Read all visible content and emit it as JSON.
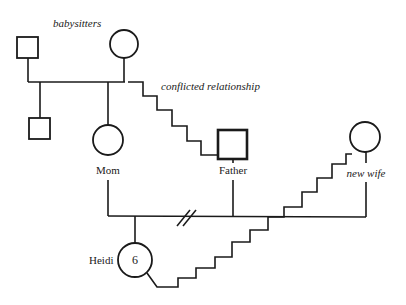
{
  "diagram": {
    "type": "genogram",
    "colors": {
      "ink": "#1a1a1a",
      "background": "#ffffff"
    },
    "labels": {
      "babysitters": "babysitters",
      "conflicted": "conflicted relationship",
      "mom": "Mom",
      "father": "Father",
      "new_wife": "new wife",
      "heidi": "Heidi",
      "heidi_age": "6"
    },
    "people": [
      {
        "id": "babysitter-male",
        "role": "babysitter",
        "sex": "male"
      },
      {
        "id": "babysitter-female",
        "role": "babysitter",
        "sex": "female"
      },
      {
        "id": "babysitters-son",
        "role": "child of babysitters",
        "sex": "male"
      },
      {
        "id": "mom",
        "name": "Mom",
        "sex": "female"
      },
      {
        "id": "father",
        "name": "Father",
        "sex": "male",
        "identified": true
      },
      {
        "id": "new-wife",
        "name": "new wife",
        "sex": "female"
      },
      {
        "id": "heidi",
        "name": "Heidi",
        "sex": "female",
        "age": 6
      }
    ],
    "relationships": [
      {
        "from": "babysitter-male",
        "to": "babysitter-female",
        "type": "marriage"
      },
      {
        "from": "mom",
        "to": "father",
        "type": "divorce"
      },
      {
        "from": "father",
        "to": "new-wife",
        "type": "marriage"
      },
      {
        "from": "babysitter-female",
        "to": "father",
        "type": "conflicted"
      },
      {
        "from": "heidi",
        "to": "new-wife",
        "type": "conflicted"
      }
    ]
  }
}
